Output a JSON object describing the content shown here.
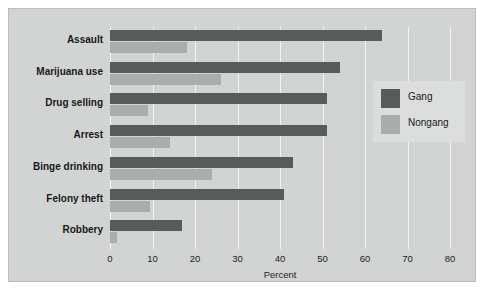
{
  "chart_data": {
    "type": "bar",
    "orientation": "horizontal",
    "title": "",
    "xlabel": "Percent",
    "ylabel": "",
    "xlim": [
      0,
      80
    ],
    "xticks": [
      0,
      10,
      20,
      30,
      40,
      50,
      60,
      70,
      80
    ],
    "grid": true,
    "legend_position": "right",
    "categories": [
      "Assault",
      "Marijuana use",
      "Drug selling",
      "Arrest",
      "Binge drinking",
      "Felony theft",
      "Robbery"
    ],
    "series": [
      {
        "name": "Gang",
        "color": "#565b5b",
        "values": [
          64,
          54,
          51,
          51,
          43,
          41,
          17
        ]
      },
      {
        "name": "Nongang",
        "color": "#a9adac",
        "values": [
          18,
          26,
          9,
          14,
          24,
          9.5,
          1.6
        ]
      }
    ]
  },
  "axis": {
    "tick_labels": [
      "0",
      "10",
      "20",
      "30",
      "40",
      "50",
      "60",
      "70",
      "80"
    ],
    "title": "Percent"
  },
  "legend": {
    "entries": [
      {
        "label": "Gang",
        "color": "#565b5b"
      },
      {
        "label": "Nongang",
        "color": "#a9adac"
      }
    ]
  },
  "colors": {
    "panel_background": "#d2d4d3",
    "figure_background": "#ffffff",
    "gridline": "#f2f3f2",
    "legend_background": "#dcdedd",
    "text": "#16181a"
  }
}
